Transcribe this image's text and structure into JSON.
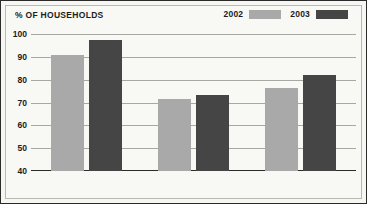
{
  "chart_data": {
    "type": "bar",
    "title": "% OF HOUSEHOLDS",
    "xlabel": "",
    "ylabel": "",
    "categories": [
      "RURAL",
      "URBAN",
      "ENGLAND"
    ],
    "series": [
      {
        "name": "2002",
        "color": "#a9a9a9",
        "values": [
          91,
          71.5,
          76.5
        ]
      },
      {
        "name": "2003",
        "color": "#454545",
        "values": [
          97.5,
          73.5,
          82
        ]
      }
    ],
    "ylim": [
      40,
      100
    ],
    "yticks": [
      100,
      90,
      80,
      70,
      60,
      50,
      40
    ],
    "ytick_labels": [
      "100",
      "90",
      "80",
      "70",
      "60",
      "50",
      "40"
    ],
    "grid": true,
    "legend_position": "top-right"
  },
  "colors": {
    "series_2002": "#a9a9a9",
    "series_2003": "#454545",
    "background": "#f8f8f5",
    "border": "#2b2b2b",
    "gridline": "#9a9a94",
    "text": "#1c1c1c"
  }
}
